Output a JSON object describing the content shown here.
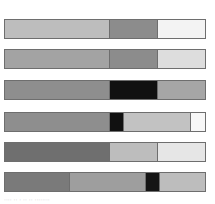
{
  "bars": [
    {
      "top": 19,
      "segments": [
        {
          "width": 106,
          "color": "#bdbdbd"
        },
        {
          "width": 49,
          "color": "#8c8c8c"
        },
        {
          "width": 47,
          "color": "#f3f3f3"
        }
      ]
    },
    {
      "top": 49,
      "segments": [
        {
          "width": 106,
          "color": "#a3a3a3"
        },
        {
          "width": 49,
          "color": "#8c8c8c"
        },
        {
          "width": 47,
          "color": "#dddddd"
        }
      ]
    },
    {
      "top": 80,
      "segments": [
        {
          "width": 106,
          "color": "#8e8e8e"
        },
        {
          "width": 49,
          "color": "#111111"
        },
        {
          "width": 47,
          "color": "#a6a6a6"
        }
      ]
    },
    {
      "top": 112,
      "segments": [
        {
          "width": 106,
          "color": "#8e8e8e"
        },
        {
          "width": 14,
          "color": "#111111"
        },
        {
          "width": 68,
          "color": "#c2c2c2"
        },
        {
          "width": 14,
          "color": "#f7f7f7"
        }
      ]
    },
    {
      "top": 142,
      "segments": [
        {
          "width": 106,
          "color": "#6f6f6f"
        },
        {
          "width": 49,
          "color": "#bdbdbd"
        },
        {
          "width": 47,
          "color": "#e6e6e6"
        }
      ]
    },
    {
      "top": 172,
      "segments": [
        {
          "width": 66,
          "color": "#7a7a7a"
        },
        {
          "width": 76,
          "color": "#9e9e9e"
        },
        {
          "width": 15,
          "color": "#151515"
        },
        {
          "width": 45,
          "color": "#bdbdbd"
        }
      ]
    }
  ],
  "caption": "···· ·· · ·· ·· ········"
}
